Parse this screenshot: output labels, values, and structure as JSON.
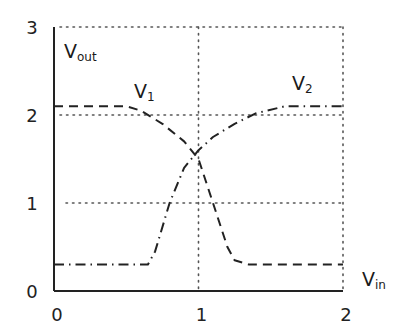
{
  "chart_data": {
    "type": "line",
    "title": "",
    "xlabel": "V_in",
    "ylabel": "V_out",
    "xlim": [
      0,
      2
    ],
    "ylim": [
      0,
      3
    ],
    "x_ticks": [
      "0",
      "1",
      "2"
    ],
    "y_ticks": [
      "0",
      "1",
      "2",
      "3"
    ],
    "grid": "dotted at x=1,2 and y=1,2,3",
    "series": [
      {
        "name": "V1",
        "style": "dashed",
        "x": [
          0.0,
          0.5,
          0.6,
          0.75,
          0.9,
          1.0,
          1.1,
          1.2,
          1.25,
          1.35,
          2.0
        ],
        "y": [
          2.1,
          2.1,
          2.05,
          1.9,
          1.7,
          1.5,
          1.0,
          0.5,
          0.35,
          0.3,
          0.3
        ]
      },
      {
        "name": "V2",
        "style": "dash-dot",
        "x": [
          0.0,
          0.65,
          0.7,
          0.8,
          0.9,
          1.0,
          1.1,
          1.25,
          1.4,
          1.6,
          2.0
        ],
        "y": [
          0.3,
          0.3,
          0.45,
          1.0,
          1.4,
          1.6,
          1.75,
          1.9,
          2.02,
          2.1,
          2.1
        ]
      }
    ],
    "annotations": [
      "V1",
      "V2"
    ]
  },
  "labels": {
    "y_axis": {
      "main": "V",
      "sub": "out"
    },
    "x_axis": {
      "main": "V",
      "sub": "in"
    },
    "v1": {
      "main": "V",
      "sub": "1"
    },
    "v2": {
      "main": "V",
      "sub": "2"
    }
  }
}
